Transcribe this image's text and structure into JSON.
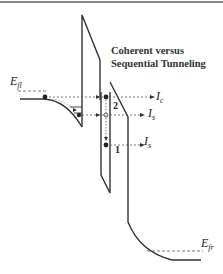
{
  "title": {
    "line1": "Coherent versus",
    "line2": "Sequential Tunneling"
  },
  "labels": {
    "efl_main": "E",
    "efl_sub": "fl",
    "efr_main": "E",
    "efr_sub": "fr",
    "ic_main": "I",
    "ic_sub": "c",
    "is_upper_main": "I",
    "is_upper_sub": "s",
    "is_lower_main": "I",
    "is_lower_sub": "s",
    "level_2": "2",
    "level_1": "1"
  },
  "colors": {
    "line": "#333333",
    "dashed": "#555555",
    "border": "#8a8a8a"
  }
}
